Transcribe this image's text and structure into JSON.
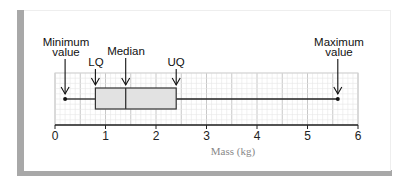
{
  "chart_data": {
    "type": "boxplot",
    "title": "",
    "xlabel": "Mass (kg)",
    "ylabel": "",
    "xlim": [
      0,
      6
    ],
    "xticks": [
      "0",
      "1",
      "2",
      "3",
      "4",
      "5",
      "6"
    ],
    "grid": true,
    "summary": {
      "minimum": 0.2,
      "lower_quartile": 0.8,
      "median": 1.4,
      "upper_quartile": 2.4,
      "maximum": 5.6
    },
    "annotations": [
      {
        "label": "Minimum value",
        "value": 0.2
      },
      {
        "label": "LQ",
        "value": 0.8
      },
      {
        "label": "Median",
        "value": 1.4
      },
      {
        "label": "UQ",
        "value": 2.4
      },
      {
        "label": "Maximum value",
        "value": 5.6
      }
    ],
    "colors": {
      "box_fill": "#e2e2e2",
      "grid": "#d8d8d8",
      "frame_shadow": "#a8a8a8"
    }
  },
  "labels": {
    "min_line1": "Minimum",
    "min_line2": "value",
    "lq": "LQ",
    "median": "Median",
    "uq": "UQ",
    "max_line1": "Maximum",
    "max_line2": "value",
    "xlabel": "Mass (kg)",
    "ticks": [
      "0",
      "1",
      "2",
      "3",
      "4",
      "5",
      "6"
    ]
  }
}
